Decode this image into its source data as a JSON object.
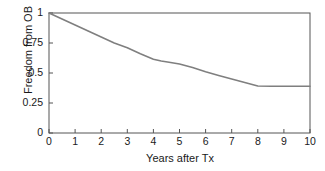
{
  "chart_data": {
    "type": "line",
    "title": "",
    "subtitle": "",
    "xlabel": "Years after Tx",
    "ylabel": "Freedom from OB",
    "xlim": [
      0,
      10
    ],
    "ylim": [
      0,
      1
    ],
    "xticks": [
      0,
      1,
      2,
      3,
      4,
      5,
      6,
      7,
      8,
      9,
      10
    ],
    "xtick_labels": [
      "0",
      "1",
      "2",
      "3",
      "4",
      "5",
      "6",
      "7",
      "8",
      "9",
      "10"
    ],
    "yticks": [
      0,
      0.25,
      0.5,
      0.75,
      1
    ],
    "ytick_labels": [
      "0",
      "0.25",
      "0.5",
      "0.75",
      "1"
    ],
    "grid": false,
    "legend": false,
    "legend_position": "none",
    "annotations": [],
    "series": [
      {
        "name": "Freedom from OB",
        "color": "#7f7f7f",
        "line_width": 1.6,
        "x": [
          0,
          0.5,
          1,
          1.5,
          2,
          2.5,
          3,
          3.5,
          4,
          4.3,
          4.6,
          5,
          5.5,
          6,
          6.5,
          7,
          7.5,
          8,
          8.5,
          9,
          9.5,
          10
        ],
        "values": [
          1.0,
          0.95,
          0.9,
          0.85,
          0.8,
          0.75,
          0.71,
          0.66,
          0.615,
          0.6,
          0.59,
          0.575,
          0.545,
          0.51,
          0.48,
          0.45,
          0.42,
          0.392,
          0.39,
          0.39,
          0.39,
          0.39
        ]
      }
    ],
    "style": {
      "background": "#ffffff",
      "axis_color": "#555555",
      "text_color": "#1a1a1a",
      "box_border": true,
      "tick_direction": "in"
    }
  }
}
